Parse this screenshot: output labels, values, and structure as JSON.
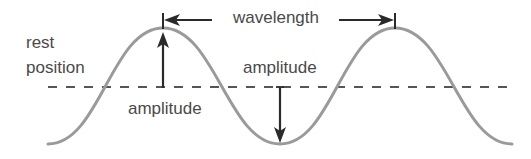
{
  "diagram": {
    "labels": {
      "rest_line1": "rest",
      "rest_line2": "position",
      "wavelength": "wavelength",
      "amplitude_crest": "amplitude",
      "amplitude_trough": "amplitude"
    },
    "colors": {
      "wave": "#9a9a9a",
      "rest_line": "#555555",
      "arrows": "#2a2a2a",
      "text": "#4a4a4a",
      "background": "#ffffff"
    },
    "geometry": {
      "rest_y": 87,
      "crest_y": 28,
      "trough_y": 144,
      "crest_x": [
        163,
        395
      ],
      "trough_x": 280,
      "wave_start_x": 48,
      "wave_end_x": 512
    }
  }
}
